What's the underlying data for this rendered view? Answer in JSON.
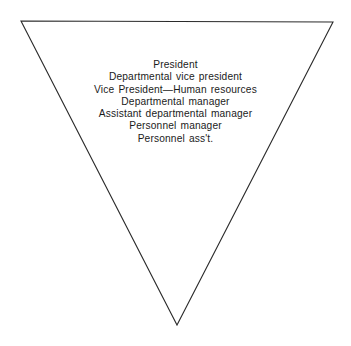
{
  "figure": {
    "shape": "inverted-triangle",
    "background_color": "#ffffff",
    "outline_color": "#2b2b2b",
    "outline_width_px": 1,
    "text_color": "#1b1b1b",
    "vertices": {
      "top_left": [
        21,
        21
      ],
      "top_right": [
        333,
        22
      ],
      "bottom_apex": [
        177,
        325
      ]
    }
  },
  "hierarchy": {
    "levels": [
      {
        "label": "President"
      },
      {
        "label": "Departmental vice president"
      },
      {
        "label": "Vice President—Human resources"
      },
      {
        "label": "Departmental manager"
      },
      {
        "label": "Assistant departmental manager"
      },
      {
        "label": "Personnel manager"
      },
      {
        "label": "Personnel ass't."
      }
    ]
  }
}
